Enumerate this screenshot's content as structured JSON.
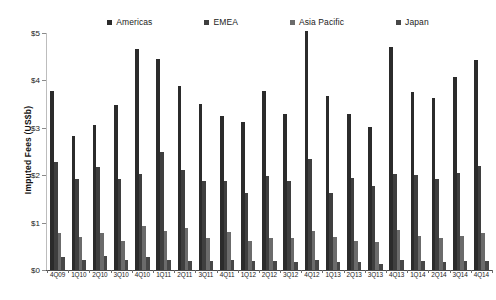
{
  "chart_data": {
    "type": "bar",
    "title": "",
    "xlabel": "",
    "ylabel": "Imputed Fees (US$b)",
    "ylim": [
      0,
      5
    ],
    "ytick_labels": [
      "$0",
      "$1",
      "$2",
      "$3",
      "$4",
      "$5"
    ],
    "ytick_values": [
      0,
      1,
      2,
      3,
      4,
      5
    ],
    "grid": false,
    "legend_position": "top",
    "categories": [
      "4Q09",
      "1Q10",
      "2Q10",
      "3Q10",
      "4Q10",
      "1Q11",
      "2Q11",
      "3Q11",
      "4Q11",
      "1Q12",
      "2Q12",
      "3Q12",
      "4Q12",
      "1Q13",
      "2Q13",
      "3Q13",
      "4Q13",
      "1Q14",
      "2Q14",
      "3Q14",
      "4Q14"
    ],
    "series": [
      {
        "name": "Americas",
        "color": "#2b2b2b",
        "values": [
          3.78,
          2.82,
          3.05,
          3.48,
          4.66,
          4.45,
          3.88,
          3.5,
          3.25,
          3.12,
          3.78,
          3.3,
          5.05,
          3.68,
          3.3,
          3.02,
          4.7,
          3.75,
          3.62,
          4.08,
          4.43
        ]
      },
      {
        "name": "EMEA",
        "color": "#3f3f3f",
        "values": [
          2.28,
          1.92,
          2.18,
          1.92,
          2.03,
          2.48,
          2.12,
          1.88,
          1.88,
          1.62,
          1.98,
          1.88,
          2.35,
          1.62,
          1.95,
          1.78,
          2.02,
          2.0,
          1.92,
          2.05,
          2.2
        ]
      },
      {
        "name": "Asia Pacific",
        "color": "#6b6b6b",
        "values": [
          0.78,
          0.7,
          0.78,
          0.62,
          0.92,
          0.82,
          0.88,
          0.68,
          0.8,
          0.62,
          0.68,
          0.68,
          0.82,
          0.7,
          0.62,
          0.6,
          0.85,
          0.72,
          0.68,
          0.72,
          0.78
        ]
      },
      {
        "name": "Japan",
        "color": "#474747",
        "values": [
          0.28,
          0.22,
          0.3,
          0.22,
          0.28,
          0.22,
          0.2,
          0.2,
          0.22,
          0.18,
          0.18,
          0.16,
          0.22,
          0.16,
          0.16,
          0.12,
          0.22,
          0.18,
          0.16,
          0.18,
          0.2
        ]
      }
    ]
  }
}
